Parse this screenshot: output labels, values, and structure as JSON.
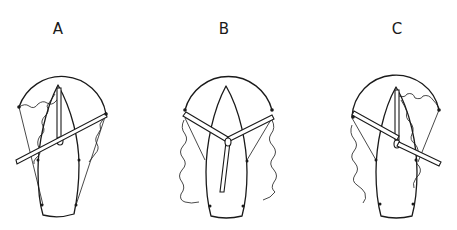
{
  "figure": {
    "panels": [
      {
        "id": "A",
        "label": "A",
        "label_x": 58,
        "description": "Boom swung to port-forward, sail on starboard side"
      },
      {
        "id": "B",
        "label": "B",
        "label_x": 224,
        "description": "Two booms spread wing-and-wing, mast stepped aft"
      },
      {
        "id": "C",
        "label": "C",
        "label_x": 397,
        "description": "Boom swung to starboard-aft, sail on port side"
      }
    ]
  },
  "colors": {
    "line": "#1a1a1a",
    "background": "#ffffff"
  }
}
